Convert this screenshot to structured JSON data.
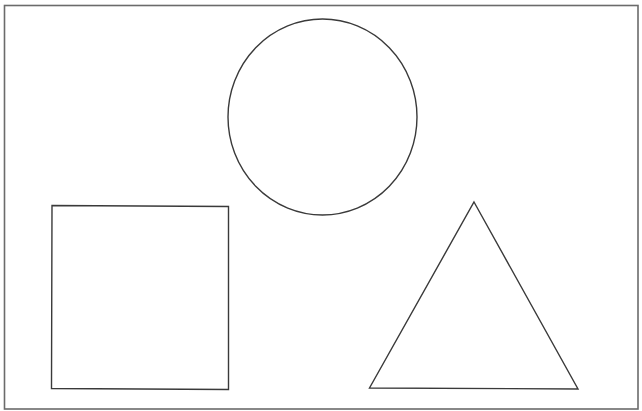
{
  "diagram": {
    "title": "",
    "colors": {
      "background": "#ffffff",
      "frame_stroke": "#6b6b6b",
      "shape_stroke": "#3a3a3a",
      "shape_fill": "none"
    },
    "shapes": [
      {
        "id": "circle",
        "kind": "circle",
        "label": ""
      },
      {
        "id": "square",
        "kind": "square",
        "label": ""
      },
      {
        "id": "triangle",
        "kind": "triangle",
        "label": ""
      }
    ]
  }
}
